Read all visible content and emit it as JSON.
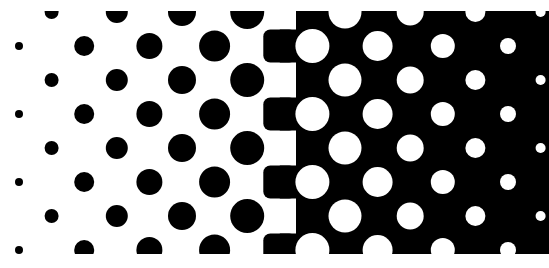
{
  "image": {
    "description": "Halftone gradient pattern: black dots on white growing left-to-right, inverting to white dots on black shrinking toward the right edge",
    "width": 549,
    "height": 268,
    "colors": {
      "background": "#ffffff",
      "ink": "#000000",
      "paper": "#ffffff"
    },
    "clip": {
      "x": 0,
      "y": 11,
      "width": 549,
      "height": 243
    }
  },
  "lattice": {
    "column_x": [
      19,
      51.6,
      84.2,
      116.8,
      149.4,
      182,
      214.6,
      247.2,
      279.8,
      312.4,
      345,
      377.6,
      410.2,
      442.8,
      475.4,
      508,
      540.6
    ],
    "rows_even": [
      46,
      114,
      182,
      250
    ],
    "rows_odd": [
      12,
      80,
      148,
      216
    ]
  },
  "black_dots": [
    {
      "col": 0,
      "rows": "even",
      "r": 4
    },
    {
      "col": 1,
      "rows": "odd",
      "r": 7
    },
    {
      "col": 2,
      "rows": "even",
      "r": 10
    },
    {
      "col": 3,
      "rows": "odd",
      "r": 11
    },
    {
      "col": 4,
      "rows": "even",
      "r": 13
    },
    {
      "col": 5,
      "rows": "odd",
      "r": 14
    },
    {
      "col": 6,
      "rows": "even",
      "r": 15.5
    },
    {
      "col": 7,
      "rows": "odd",
      "r": 17
    }
  ],
  "transition_squares": {
    "col": 8,
    "rows": "even",
    "size": 33,
    "corner": 7
  },
  "black_field_start_x": 296,
  "white_dots": [
    {
      "col": 9,
      "rows": "even",
      "r": 17
    },
    {
      "col": 10,
      "rows": "odd",
      "r": 16.5
    },
    {
      "col": 11,
      "rows": "even",
      "r": 15
    },
    {
      "col": 12,
      "rows": "odd",
      "r": 13.5
    },
    {
      "col": 13,
      "rows": "even",
      "r": 12
    },
    {
      "col": 14,
      "rows": "odd",
      "r": 10
    },
    {
      "col": 15,
      "rows": "even",
      "r": 8
    },
    {
      "col": 16,
      "rows": "odd",
      "r": 5
    }
  ]
}
